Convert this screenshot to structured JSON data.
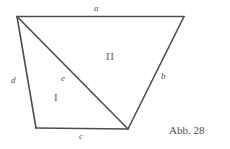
{
  "figure": {
    "caption": "Abb. 28",
    "background_color": "#ffffff",
    "stroke_color": "#4e4e4e",
    "label_color": "#4e4e4e",
    "width": 230,
    "height": 149,
    "shape": "quadrilateral-with-diagonal",
    "vertices": {
      "top_left": {
        "x": 17,
        "y": 16
      },
      "top_right": {
        "x": 184,
        "y": 16
      },
      "bottom_right": {
        "x": 128,
        "y": 129
      },
      "bottom_left": {
        "x": 36,
        "y": 128
      }
    },
    "edges": [
      {
        "name": "a",
        "label": "a",
        "from": "top_left",
        "to": "top_right",
        "style": "italic"
      },
      {
        "name": "b",
        "label": "b",
        "from": "top_right",
        "to": "bottom_right",
        "style": "italic"
      },
      {
        "name": "c",
        "label": "c",
        "from": "bottom_right",
        "to": "bottom_left",
        "style": "italic"
      },
      {
        "name": "d",
        "label": "d",
        "from": "bottom_left",
        "to": "top_left",
        "style": "italic"
      },
      {
        "name": "e",
        "label": "e",
        "from": "top_left",
        "to": "bottom_right",
        "style": "italic",
        "kind": "diagonal"
      }
    ],
    "regions": [
      {
        "name": "region-1",
        "label": "I",
        "description": "lower-left triangle bounded by d, c and diagonal e"
      },
      {
        "name": "region-2",
        "label": "II",
        "description": "upper-right triangle bounded by a, b and diagonal e"
      }
    ]
  }
}
